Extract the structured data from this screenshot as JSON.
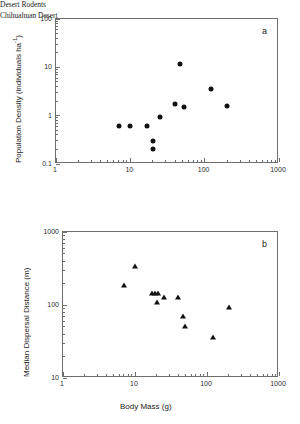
{
  "figure": {
    "panels": [
      {
        "letter": "a",
        "annotation_line1": "Desert Rodents",
        "annotation_line2": "Chihuahuan Desert"
      },
      {
        "letter": "b"
      }
    ]
  },
  "chart_data": [
    {
      "type": "scatter",
      "panel": "a",
      "title": "",
      "xlabel": "",
      "ylabel": "Population Density (individuals ha⁻¹)",
      "ylabel_text": "Population Density (individuals ha",
      "ylabel_exp": "-1",
      "ylabel_tail": ")",
      "xscale": "log",
      "yscale": "log",
      "xlim": [
        1,
        1000
      ],
      "ylim": [
        0.1,
        100
      ],
      "xticks": [
        1,
        10,
        100,
        1000
      ],
      "xticklabels": [
        "1",
        "10",
        "100",
        "1000"
      ],
      "yticks": [
        0.1,
        1,
        10,
        100
      ],
      "yticklabels": [
        "0.1",
        "1",
        "10",
        "100"
      ],
      "grid": false,
      "legend": false,
      "marker": "filled-circle",
      "marker_color": "#111111",
      "annotations": [
        "Desert Rodents",
        "Chihuahuan Desert"
      ],
      "points": [
        {
          "x": 7.0,
          "y": 0.6
        },
        {
          "x": 10.0,
          "y": 0.6
        },
        {
          "x": 17.0,
          "y": 0.6
        },
        {
          "x": 20.0,
          "y": 0.3
        },
        {
          "x": 20.0,
          "y": 0.2
        },
        {
          "x": 25.0,
          "y": 0.95
        },
        {
          "x": 40.0,
          "y": 1.75
        },
        {
          "x": 46.0,
          "y": 12.0
        },
        {
          "x": 52.0,
          "y": 1.5
        },
        {
          "x": 120.0,
          "y": 3.6
        },
        {
          "x": 200.0,
          "y": 1.55
        }
      ]
    },
    {
      "type": "scatter",
      "panel": "b",
      "title": "",
      "xlabel": "Body Mass (g)",
      "ylabel": "Median Dispersal Distance (m)",
      "xscale": "log",
      "yscale": "log",
      "xlim": [
        1,
        1000
      ],
      "ylim": [
        10,
        1000
      ],
      "xticks": [
        1,
        10,
        100,
        1000
      ],
      "xticklabels": [
        "1",
        "10",
        "100",
        "1000"
      ],
      "yticks": [
        10,
        100,
        1000
      ],
      "yticklabels": [
        "10",
        "100",
        "1000"
      ],
      "grid": false,
      "legend": false,
      "marker": "filled-triangle",
      "marker_color": "#111111",
      "points": [
        {
          "x": 7.0,
          "y": 190
        },
        {
          "x": 10.0,
          "y": 345
        },
        {
          "x": 17.0,
          "y": 145
        },
        {
          "x": 19.0,
          "y": 145
        },
        {
          "x": 21.0,
          "y": 145
        },
        {
          "x": 20.0,
          "y": 110
        },
        {
          "x": 25.0,
          "y": 128
        },
        {
          "x": 40.0,
          "y": 130
        },
        {
          "x": 46.0,
          "y": 70
        },
        {
          "x": 50.0,
          "y": 52
        },
        {
          "x": 120.0,
          "y": 36
        },
        {
          "x": 200.0,
          "y": 95
        }
      ]
    }
  ]
}
